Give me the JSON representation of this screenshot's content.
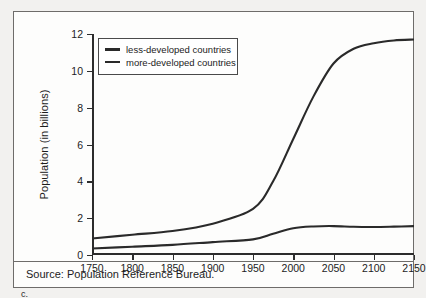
{
  "figure": {
    "caption_label": "c.",
    "source_note": "Source: Population Reference Bureau."
  },
  "chart_data": {
    "type": "line",
    "title": "",
    "xlabel": "",
    "ylabel": "Population (in billions)",
    "xlim": [
      1750,
      2150
    ],
    "ylim": [
      0,
      12
    ],
    "xticks": [
      1750,
      1800,
      1850,
      1900,
      1950,
      2000,
      2050,
      2100,
      2150
    ],
    "yticks": [
      0,
      2,
      4,
      6,
      8,
      10,
      12
    ],
    "grid": false,
    "legend_position": "upper-left-inside",
    "line_color": "#2a2a2a",
    "x": [
      1750,
      1800,
      1850,
      1900,
      1950,
      1975,
      2000,
      2025,
      2050,
      2075,
      2100,
      2125,
      2150
    ],
    "series": [
      {
        "name": "less-developed countries",
        "values": [
          0.9,
          1.1,
          1.3,
          1.7,
          2.5,
          4.0,
          6.3,
          8.6,
          10.4,
          11.2,
          11.5,
          11.65,
          11.7
        ]
      },
      {
        "name": "more-developed countries",
        "values": [
          0.35,
          0.45,
          0.55,
          0.7,
          0.85,
          1.15,
          1.45,
          1.55,
          1.57,
          1.53,
          1.52,
          1.54,
          1.57
        ]
      }
    ]
  }
}
